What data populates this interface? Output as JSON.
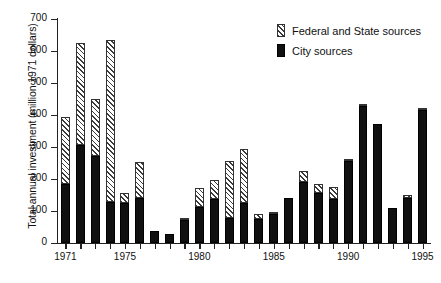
{
  "chart_data": {
    "type": "bar",
    "stacked": true,
    "title": "",
    "xlabel": "",
    "ylabel": "Total annual investment (million 1971 dollars)",
    "ylim": [
      0,
      700
    ],
    "ytick_values": [
      0,
      100,
      200,
      300,
      400,
      500,
      600,
      700
    ],
    "ytick_labels": [
      "0",
      "100",
      "200",
      "300",
      "400",
      "500",
      "600",
      "700"
    ],
    "xtick_labels": [
      "1971",
      "1975",
      "1980",
      "1985",
      "1990",
      "1995"
    ],
    "xtick_years": [
      1971,
      1975,
      1980,
      1985,
      1990,
      1995
    ],
    "grid": false,
    "legend_position": "top-right",
    "categories": [
      1971,
      1972,
      1973,
      1974,
      1975,
      1976,
      1977,
      1978,
      1979,
      1980,
      1981,
      1982,
      1983,
      1984,
      1985,
      1986,
      1987,
      1988,
      1989,
      1990,
      1991,
      1992,
      1993,
      1994,
      1995
    ],
    "series": [
      {
        "name": "City sources",
        "color": "#101010",
        "values": [
          185,
          305,
          272,
          129,
          124,
          142,
          38,
          27,
          72,
          114,
          137,
          79,
          126,
          75,
          92,
          140,
          190,
          157,
          137,
          257,
          428,
          371,
          110,
          142,
          415
        ]
      },
      {
        "name": "Federal and State sources",
        "color": "#f2f2f2",
        "hatch": "diagonal-stripes",
        "values": [
          209,
          319,
          178,
          505,
          33,
          111,
          0,
          0,
          3,
          57,
          61,
          178,
          168,
          15,
          3,
          0,
          36,
          29,
          38,
          7,
          5,
          0,
          0,
          9,
          5
        ]
      }
    ],
    "totals": [
      394,
      624,
      450,
      634,
      157,
      253,
      38,
      27,
      75,
      171,
      198,
      257,
      294,
      90,
      95,
      140,
      226,
      186,
      175,
      264,
      433,
      371,
      110,
      151,
      420
    ]
  },
  "legend": {
    "items": [
      {
        "label": "Federal and State sources",
        "swatch": "hatched"
      },
      {
        "label": "City sources",
        "swatch": "solid-black"
      }
    ]
  }
}
